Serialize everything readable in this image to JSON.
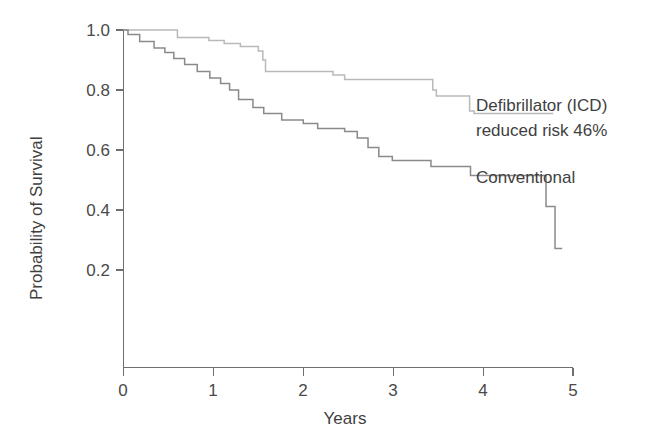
{
  "chart_data": {
    "type": "line",
    "title": "",
    "xlabel": "Years",
    "ylabel": "Probability of Survival",
    "xlim": [
      0,
      5
    ],
    "ylim": [
      0,
      1.0
    ],
    "grid": false,
    "legend_position": "inline-annotation-right",
    "x_ticks": [
      "0",
      "1",
      "2",
      "3",
      "4",
      "5"
    ],
    "x_tick_values": [
      0,
      1,
      2,
      3,
      4,
      5
    ],
    "y_ticks": [
      "0.2",
      "0.4",
      "0.6",
      "0.8",
      "1.0"
    ],
    "y_tick_values": [
      0.2,
      0.4,
      0.6,
      0.8,
      1.0
    ],
    "curve_style": "kaplan-meier-step",
    "series": [
      {
        "name": "Defibrillator (ICD)",
        "color": "#b9b9b9",
        "points": [
          [
            0.0,
            1.0
          ],
          [
            0.58,
            1.0
          ],
          [
            0.6,
            0.975
          ],
          [
            0.9,
            0.975
          ],
          [
            0.95,
            0.965
          ],
          [
            1.08,
            0.965
          ],
          [
            1.12,
            0.955
          ],
          [
            1.25,
            0.955
          ],
          [
            1.3,
            0.945
          ],
          [
            1.45,
            0.945
          ],
          [
            1.5,
            0.93
          ],
          [
            1.55,
            0.9
          ],
          [
            1.58,
            0.862
          ],
          [
            2.28,
            0.862
          ],
          [
            2.33,
            0.85
          ],
          [
            2.42,
            0.85
          ],
          [
            2.46,
            0.835
          ],
          [
            3.4,
            0.835
          ],
          [
            3.44,
            0.8
          ],
          [
            3.48,
            0.78
          ],
          [
            3.8,
            0.78
          ],
          [
            3.85,
            0.73
          ],
          [
            3.9,
            0.722
          ],
          [
            4.78,
            0.722
          ]
        ]
      },
      {
        "name": "Conventional",
        "color": "#8a8a8a",
        "points": [
          [
            0.0,
            1.0
          ],
          [
            0.05,
            0.985
          ],
          [
            0.14,
            0.985
          ],
          [
            0.18,
            0.962
          ],
          [
            0.3,
            0.962
          ],
          [
            0.34,
            0.94
          ],
          [
            0.42,
            0.94
          ],
          [
            0.46,
            0.925
          ],
          [
            0.52,
            0.925
          ],
          [
            0.56,
            0.905
          ],
          [
            0.64,
            0.905
          ],
          [
            0.68,
            0.885
          ],
          [
            0.78,
            0.885
          ],
          [
            0.82,
            0.862
          ],
          [
            0.92,
            0.862
          ],
          [
            0.96,
            0.84
          ],
          [
            1.04,
            0.84
          ],
          [
            1.08,
            0.822
          ],
          [
            1.14,
            0.822
          ],
          [
            1.18,
            0.8
          ],
          [
            1.24,
            0.8
          ],
          [
            1.28,
            0.768
          ],
          [
            1.4,
            0.768
          ],
          [
            1.44,
            0.742
          ],
          [
            1.52,
            0.742
          ],
          [
            1.56,
            0.722
          ],
          [
            1.72,
            0.722
          ],
          [
            1.76,
            0.7
          ],
          [
            1.96,
            0.7
          ],
          [
            2.0,
            0.688
          ],
          [
            2.12,
            0.688
          ],
          [
            2.16,
            0.672
          ],
          [
            2.42,
            0.672
          ],
          [
            2.46,
            0.662
          ],
          [
            2.56,
            0.662
          ],
          [
            2.6,
            0.64
          ],
          [
            2.68,
            0.64
          ],
          [
            2.72,
            0.608
          ],
          [
            2.8,
            0.608
          ],
          [
            2.84,
            0.578
          ],
          [
            2.95,
            0.578
          ],
          [
            2.99,
            0.565
          ],
          [
            3.38,
            0.565
          ],
          [
            3.42,
            0.545
          ],
          [
            3.82,
            0.545
          ],
          [
            3.86,
            0.515
          ],
          [
            4.66,
            0.515
          ],
          [
            4.7,
            0.412
          ],
          [
            4.76,
            0.412
          ],
          [
            4.8,
            0.272
          ],
          [
            4.88,
            0.272
          ]
        ]
      }
    ],
    "annotations": [
      {
        "id": "icd-annotation",
        "lines": [
          "Defibrillator (ICD)",
          "reduced risk 46%"
        ],
        "x": 4.94,
        "y": 0.775
      },
      {
        "id": "conventional-annotation",
        "lines": [
          "Conventional"
        ],
        "x": 4.94,
        "y": 0.565
      }
    ]
  },
  "axis": {
    "y_title": "Probability of Survival",
    "x_title": "Years"
  },
  "labels": {
    "y0": "0.2",
    "y1": "0.4",
    "y2": "0.6",
    "y3": "0.8",
    "y4": "1.0",
    "x0": "0",
    "x1": "1",
    "x2": "2",
    "x3": "3",
    "x4": "4",
    "x5": "5",
    "icd_line1": "Defibrillator (ICD)",
    "icd_line2": "reduced risk 46%",
    "conventional": "Conventional"
  }
}
